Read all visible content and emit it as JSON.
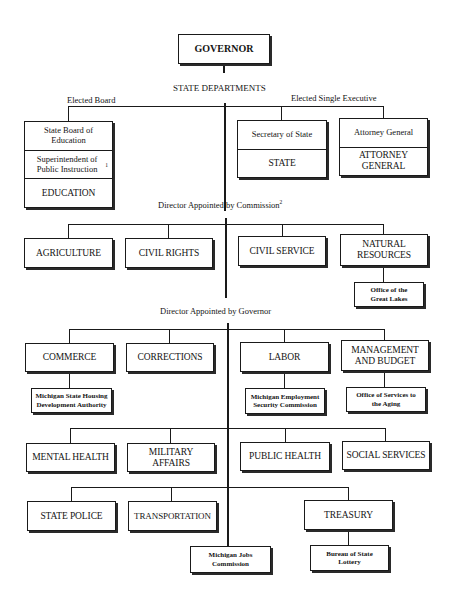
{
  "title": "GOVERNOR",
  "section_labels": {
    "state_departments": "STATE DEPARTMENTS",
    "elected_board": "Elected Board",
    "elected_single_executive": "Elected Single Executive",
    "appointed_by_commission": "Director Appointed by Commission",
    "appointed_by_commission_note": "2",
    "appointed_by_governor": "Director Appointed by Governor"
  },
  "elected_board": {
    "board": "State Board of Education",
    "superintendent": "Superintendent of Public Instruction",
    "superintendent_note": "1",
    "department": "EDUCATION"
  },
  "elected_executive": [
    {
      "official": "Secretary of State",
      "department": "STATE"
    },
    {
      "official": "Attorney General",
      "department": "ATTORNEY GENERAL"
    }
  ],
  "commission_departments": [
    {
      "name": "AGRICULTURE"
    },
    {
      "name": "CIVIL RIGHTS"
    },
    {
      "name": "CIVIL SERVICE"
    },
    {
      "name": "NATURAL RESOURCES",
      "sub": "Office of the Great Lakes"
    }
  ],
  "governor_departments_row1": [
    {
      "name": "COMMERCE",
      "sub": "Michigan State Housing Development Authority"
    },
    {
      "name": "CORRECTIONS"
    },
    {
      "name": "LABOR",
      "sub": "Michigan Employment Security Commission"
    },
    {
      "name": "MANAGEMENT AND BUDGET",
      "sub": "Office of Services to the Aging"
    }
  ],
  "governor_departments_row2": [
    {
      "name": "MENTAL HEALTH"
    },
    {
      "name": "MILITARY AFFAIRS"
    },
    {
      "name": "PUBLIC HEALTH"
    },
    {
      "name": "SOCIAL SERVICES"
    }
  ],
  "governor_departments_row3": [
    {
      "name": "STATE POLICE"
    },
    {
      "name": "TRANSPORTATION"
    },
    {
      "name": "TREASURY",
      "sub": "Bureau of State Lottery"
    }
  ],
  "direct_agency": "Michigan Jobs Commission"
}
